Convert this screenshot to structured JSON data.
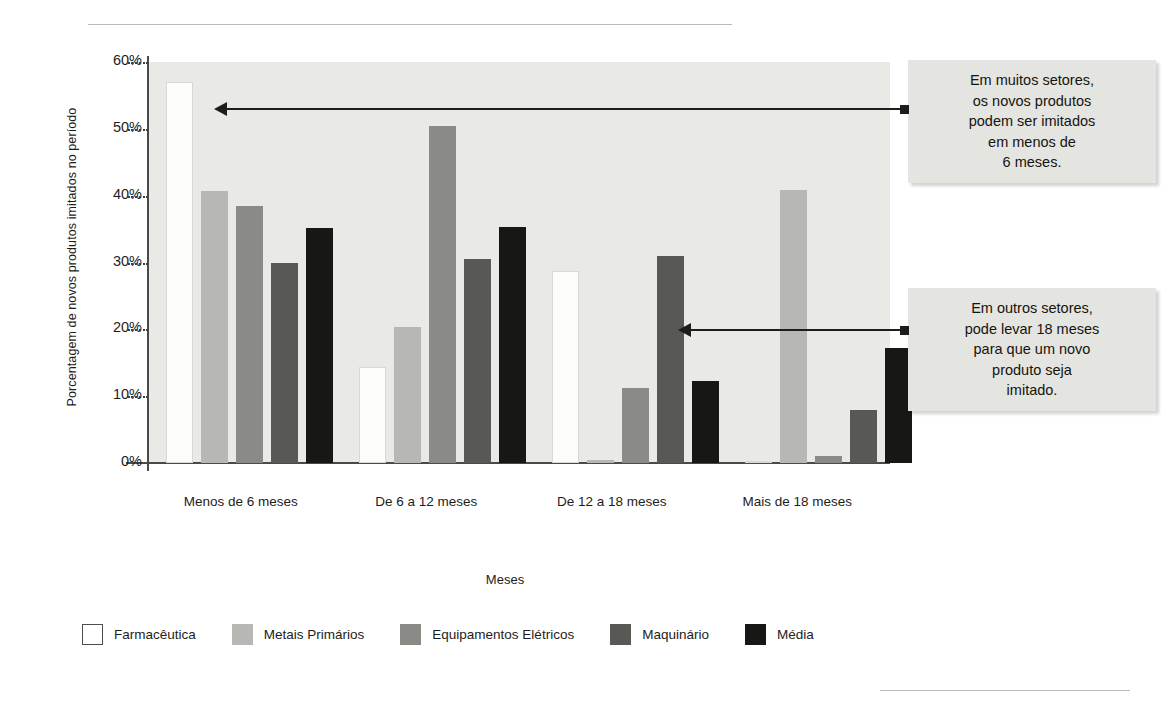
{
  "chart_data": {
    "type": "bar",
    "title": "",
    "xlabel": "Meses",
    "ylabel": "Porcentagem de novos produtos imitados no período",
    "ylim": [
      0,
      60
    ],
    "ytick_labels": [
      "60%",
      "50%",
      "40%",
      "30%",
      "20%",
      "10%",
      "0%"
    ],
    "ytick_values": [
      60,
      50,
      40,
      30,
      20,
      10,
      0
    ],
    "grid": false,
    "legend_position": "bottom",
    "categories": [
      "Menos de 6 meses",
      "De 6 a 12 meses",
      "De 12 a 18 meses",
      "Mais de 18 meses"
    ],
    "series": [
      {
        "name": "Farmacêutica",
        "color": "#ffffff",
        "values": [
          57.0,
          14.3,
          28.8,
          0.3
        ]
      },
      {
        "name": "Metais Primários",
        "color": "#b7b7b4",
        "values": [
          40.7,
          20.3,
          0.5,
          40.8
        ]
      },
      {
        "name": "Equipamentos Elétricos",
        "color": "#8a8a87",
        "values": [
          38.5,
          50.5,
          11.2,
          1.0
        ]
      },
      {
        "name": "Maquinário",
        "color": "#585855",
        "values": [
          30.0,
          30.5,
          31.0,
          7.9
        ]
      },
      {
        "name": "Média",
        "color": "#171715",
        "values": [
          35.1,
          35.3,
          12.3,
          17.2
        ]
      }
    ],
    "annotations": [
      {
        "id": "callout-1",
        "lines": [
          "Em muitos setores,",
          "os novos produtos",
          "podem ser imitados",
          "em menos de",
          "6 meses."
        ],
        "points_to": "Farmacêutica / Menos de 6 meses"
      },
      {
        "id": "callout-2",
        "lines": [
          "Em outros setores,",
          "pode levar 18 meses",
          "para que um novo",
          "produto seja",
          "imitado."
        ],
        "points_to": "Metais Primários / Mais de 18 meses"
      }
    ]
  }
}
